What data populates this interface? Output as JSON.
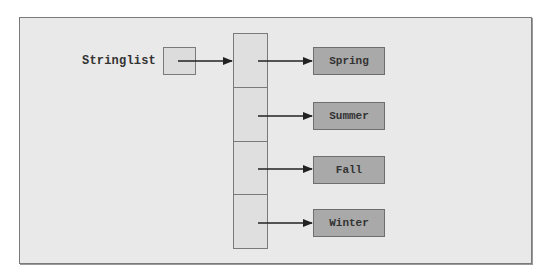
{
  "diagram": {
    "variable_label": "Stringlist",
    "array_cells": 4,
    "targets": [
      {
        "label": "Spring"
      },
      {
        "label": "Summer"
      },
      {
        "label": "Fall"
      },
      {
        "label": "Winter"
      }
    ],
    "colors": {
      "frame_background": "#e9e9e9",
      "cell_background": "#dfdfdf",
      "target_background": "#a9a9a9",
      "border": "#7a7a7a",
      "arrow": "#222222"
    }
  }
}
